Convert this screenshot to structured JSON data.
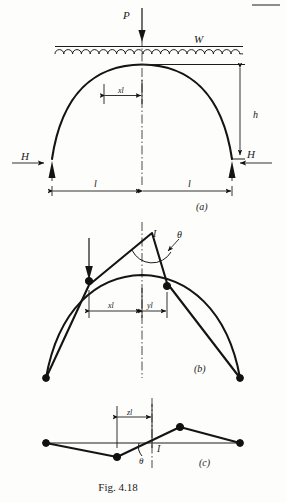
{
  "figure": {
    "number": "Fig. 4.18",
    "caption": "Fig. 4.18",
    "panels": [
      {
        "key": "a",
        "label": "(a)",
        "description": "Parabolic arch with uniformly distributed load W and point load P"
      },
      {
        "key": "b",
        "label": "(b)",
        "description": "Deflected shape with rotation angle theta at hinge I"
      },
      {
        "key": "c",
        "label": "(c)",
        "description": "Influence line diagram with rotation theta at point I"
      }
    ]
  },
  "panel_a": {
    "point_load_label": "P",
    "udl_label": "W",
    "horizontal_thrust_left": "H",
    "horizontal_thrust_right": "H",
    "rise_label": "h",
    "span_half_left": "l",
    "span_half_right": "l",
    "offset_label": "xl",
    "panel_caption": "(a)"
  },
  "panel_b": {
    "hinge_label": "I",
    "angle_label": "θ",
    "left_segment_label": "xl",
    "right_segment_label": "yl",
    "panel_caption": "(b)"
  },
  "panel_c": {
    "segment_label": "zl",
    "angle_label": "θ",
    "point_label": "I",
    "panel_caption": "(c)"
  },
  "colors": {
    "ink": "#141414",
    "thin_ink": "#1c1c1c",
    "paper": "#fdfdfb"
  },
  "geometry": {
    "panel_a": {
      "arch_left_x": 52,
      "arch_right_x": 232,
      "arch_crown_x": 142,
      "arch_crown_y": 65,
      "arch_springing_y": 159,
      "udl_y": 47,
      "centerline_x": 142
    },
    "panel_b": {
      "arch_left_x": 46,
      "arch_right_x": 240,
      "crown_x": 142,
      "crown_y": 273,
      "base_y": 367,
      "hinge_x": 142,
      "hinge_y": 236
    },
    "panel_c": {
      "baseline_y": 443,
      "left_x": 46,
      "right_x": 240,
      "trough_x": 117,
      "trough_y": 457,
      "peak_x": 180,
      "peak_y": 427,
      "cross_x": 152
    }
  }
}
